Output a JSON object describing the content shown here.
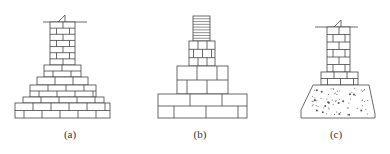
{
  "diagram": {
    "stroke_color": "#444444",
    "background": "#ffffff",
    "figures": [
      {
        "id": "a",
        "label": "(a)",
        "description": "Stepped brick foundation (wide stepped masonry footing)",
        "ground_line": {
          "x1": 43,
          "x2": 87,
          "y": 22
        },
        "column": {
          "x": 50,
          "y": 22,
          "w": 25,
          "h": 43,
          "courses": 7
        },
        "steps": [
          {
            "x": 44,
            "y": 65,
            "w": 37,
            "h": 12,
            "courses": 2
          },
          {
            "x": 37,
            "y": 77,
            "w": 51,
            "h": 8,
            "courses": 1
          },
          {
            "x": 30,
            "y": 85,
            "w": 66,
            "h": 12,
            "courses": 2
          },
          {
            "x": 23,
            "y": 97,
            "w": 81,
            "h": 6,
            "courses": 1
          },
          {
            "x": 15,
            "y": 103,
            "w": 95,
            "h": 15,
            "courses": 2
          }
        ]
      },
      {
        "id": "b",
        "label": "(b)",
        "description": "Stone/large block stepped foundation",
        "column": {
          "x": 193,
          "y": 16,
          "w": 17,
          "h": 25,
          "lines": 9
        },
        "steps": [
          {
            "x": 189,
            "y": 41,
            "w": 26,
            "h": 25,
            "courses": 3
          },
          {
            "x": 177,
            "y": 66,
            "w": 51,
            "h": 28,
            "courses": 2
          },
          {
            "x": 158,
            "y": 94,
            "w": 89,
            "h": 24,
            "courses": 2
          }
        ]
      },
      {
        "id": "c",
        "label": "(c)",
        "description": "Brick wall on concrete footing",
        "ground_line": {
          "x1": 315,
          "x2": 358,
          "y": 27
        },
        "column": {
          "x": 327,
          "y": 27,
          "w": 23,
          "h": 45,
          "courses": 6
        },
        "steps": [
          {
            "x": 321,
            "y": 72,
            "w": 37,
            "h": 13,
            "courses": 2
          }
        ],
        "concrete": {
          "top_x1": 313,
          "top_x2": 369,
          "top_y": 85,
          "bottom_x1": 301,
          "bottom_x2": 375,
          "bottom_y": 118
        }
      }
    ]
  }
}
